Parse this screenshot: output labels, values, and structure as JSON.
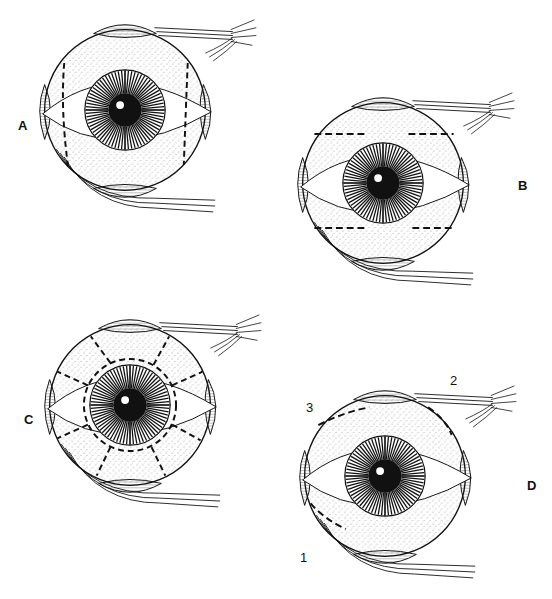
{
  "figure": {
    "panels": [
      {
        "id": "A",
        "label": "A",
        "incision": "vertical dashed lines at nasal and temporal limbus sides",
        "center": [
          125,
          110
        ]
      },
      {
        "id": "B",
        "label": "B",
        "incision": "horizontal dashed lines above and below cornea",
        "center": [
          383,
          183
        ]
      },
      {
        "id": "C",
        "label": "C",
        "incision": "circumferential dashed ring around cornea with radial dashed relaxing cuts",
        "center": [
          130,
          405
        ]
      },
      {
        "id": "D",
        "label": "D",
        "incision": "curved dashed lines at superior-nasal and inferior-nasal quadrants",
        "center": [
          385,
          476
        ]
      }
    ],
    "numbered_labels": [
      {
        "label": "1"
      },
      {
        "label": "2"
      },
      {
        "label": "3"
      }
    ],
    "colors": {
      "ink": "#111111",
      "background": "#ffffff"
    }
  }
}
